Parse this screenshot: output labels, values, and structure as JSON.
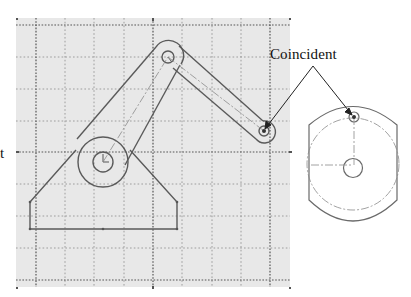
{
  "figure": {
    "callout": {
      "text": "Coincident"
    },
    "cut_off_text": {
      "text": "t"
    },
    "corner_marks": {
      "top_left": "c",
      "top_mid": "s",
      "top_right": "a",
      "mid_left": "B",
      "mid_right": "B",
      "bottom_left": "c",
      "bottom_mid": "s",
      "bottom_right": "p"
    },
    "colors": {
      "grid_background": "#e8e8e8",
      "grid_line": "#8a8a8a",
      "major_line": "#555555",
      "part_outline": "#5a5a5a",
      "centerline": "#8a8a8a",
      "arrow": "#222222",
      "point": "#333333"
    },
    "sketch_grid": {
      "x_range": [
        16,
        290
      ],
      "y_range": [
        18,
        287
      ],
      "vertical_lines": [
        36,
        65,
        94,
        124,
        153,
        182,
        212,
        241,
        270
      ],
      "horizontal_lines": [
        25,
        57,
        89,
        121,
        152,
        184,
        216,
        248,
        280
      ],
      "major_vertical": [
        36,
        153,
        270
      ],
      "major_horizontal": [
        25,
        152,
        280
      ]
    },
    "mechanism": {
      "base": {
        "name": "triangular-base",
        "pivot": [
          103,
          162
        ]
      },
      "link1": {
        "name": "crank-link",
        "from": [
          103,
          162
        ],
        "to": [
          168,
          57
        ]
      },
      "link2": {
        "name": "coupler-link",
        "from": [
          168,
          57
        ],
        "to": [
          264,
          131
        ]
      },
      "coincident_point": [
        264,
        131
      ]
    },
    "detail_view": {
      "name": "wheel-part",
      "center": [
        353,
        168
      ],
      "hub_radius": 9,
      "pitch_radius": 50,
      "coincident_point": [
        353,
        118
      ]
    }
  }
}
